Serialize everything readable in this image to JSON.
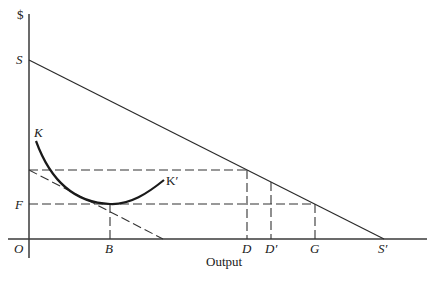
{
  "diagram": {
    "y_axis_label": "$",
    "x_axis_label": "Output",
    "origin_label": "O",
    "labels": {
      "S": "S",
      "S_prime": "S′",
      "K": "K",
      "K_prime": "K′",
      "F": "F",
      "B": "B",
      "D": "D",
      "D_prime": "D′",
      "G": "G"
    },
    "colors": {
      "ink": "#1a1a1a",
      "background": "#ffffff"
    }
  }
}
